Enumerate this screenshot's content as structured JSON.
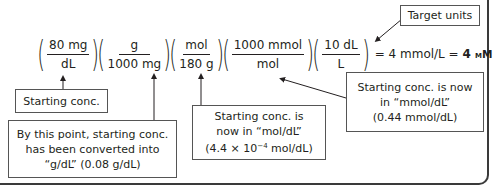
{
  "equation": {
    "factors": [
      {
        "numerator": "80 mg",
        "denominator": "dL"
      },
      {
        "numerator": "g",
        "denominator": "1000 mg"
      },
      {
        "numerator": "mol",
        "denominator": "180 g"
      },
      {
        "numerator": "1000 mmol",
        "denominator": "mol"
      },
      {
        "numerator": "10 dL",
        "denominator": "L"
      }
    ],
    "result_prefix": "= 4 mmol/L =",
    "result_value": "4",
    "result_unit": "mM"
  },
  "callouts": {
    "target_units": "Target units",
    "starting_conc": "Starting conc.",
    "grams": {
      "line1": "By this point, starting conc.",
      "line2": "has been converted into",
      "line3": "“g/dL” (0.08 g/dL)"
    },
    "moles": {
      "line1": "Starting conc. is",
      "line2": "now in “mol/dL”",
      "line3_prefix": "(4.4 × 10",
      "line3_exp": "−4",
      "line3_suffix": " mol/dL)"
    },
    "millimoles": {
      "line1": "Starting conc. is now",
      "line2": "in “mmol/dL”",
      "line3": "(0.44 mmol/dL)"
    }
  }
}
